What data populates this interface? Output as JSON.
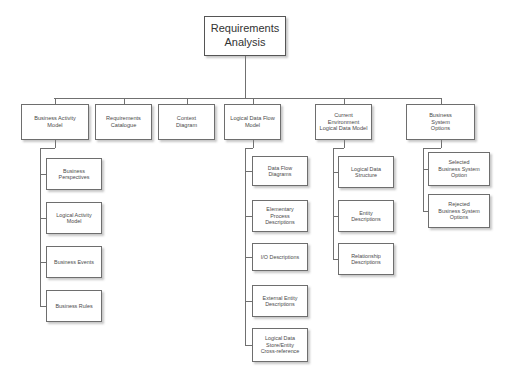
{
  "diagram": {
    "title": "Requirements Analysis",
    "root": {
      "label": "Requirements\nAnalysis",
      "x": 204,
      "y": 16,
      "w": 82,
      "h": 40
    },
    "connector_bar": {
      "y": 98,
      "x_start": 54,
      "x_end": 441
    },
    "columns": [
      {
        "id": "business-activity-model",
        "label": "Business Activity\nModel",
        "x": 21,
        "y": 104,
        "w": 68,
        "h": 36,
        "rail_x": 40,
        "children": [
          {
            "id": "business-perspectives",
            "label": "Business\nPerspectives",
            "x": 46,
            "y": 158,
            "w": 56,
            "h": 32
          },
          {
            "id": "logical-activity-model",
            "label": "Logical Activity\nModel",
            "x": 46,
            "y": 202,
            "w": 56,
            "h": 32
          },
          {
            "id": "business-events",
            "label": "Business Events",
            "x": 46,
            "y": 246,
            "w": 56,
            "h": 32
          },
          {
            "id": "business-rules",
            "label": "Business Rules",
            "x": 46,
            "y": 290,
            "w": 56,
            "h": 32
          }
        ]
      },
      {
        "id": "requirements-catalogue",
        "label": "Requirements\nCatalogue",
        "x": 95,
        "y": 104,
        "w": 57,
        "h": 36,
        "rail_x": null,
        "children": []
      },
      {
        "id": "context-diagram",
        "label": "Context\nDiagram",
        "x": 158,
        "y": 104,
        "w": 57,
        "h": 36,
        "rail_x": null,
        "children": []
      },
      {
        "id": "logical-data-flow-model",
        "label": "Logical Data Flow\nModel",
        "x": 224,
        "y": 104,
        "w": 57,
        "h": 36,
        "rail_x": 245,
        "children": [
          {
            "id": "data-flow-diagrams",
            "label": "Data Flow\nDiagrams",
            "x": 252,
            "y": 156,
            "w": 56,
            "h": 30
          },
          {
            "id": "elementary-process-descriptions",
            "label": "Elementary\nProcess\nDescriptions",
            "x": 252,
            "y": 200,
            "w": 56,
            "h": 32
          },
          {
            "id": "io-descriptions",
            "label": "I/O Descriptions",
            "x": 252,
            "y": 243,
            "w": 56,
            "h": 28
          },
          {
            "id": "external-entity-descriptions",
            "label": "External Entity\nDescriptions",
            "x": 252,
            "y": 285,
            "w": 56,
            "h": 32
          },
          {
            "id": "logical-data-store-entity-cross-reference",
            "label": "Logical Data\nStore/Entity\nCross-reference",
            "x": 252,
            "y": 328,
            "w": 56,
            "h": 34
          }
        ]
      },
      {
        "id": "current-environment-logical-data-model",
        "label": "Current\nEnvironment\nLogical Data Model",
        "x": 315,
        "y": 104,
        "w": 57,
        "h": 36,
        "rail_x": 333,
        "children": [
          {
            "id": "logical-data-structure",
            "label": "Logical Data\nStructure",
            "x": 338,
            "y": 156,
            "w": 56,
            "h": 32
          },
          {
            "id": "entity-descriptions",
            "label": "Entity\nDescriptions",
            "x": 338,
            "y": 200,
            "w": 56,
            "h": 32
          },
          {
            "id": "relationship-descriptions",
            "label": "Relationship\nDescriptions",
            "x": 338,
            "y": 243,
            "w": 56,
            "h": 32
          }
        ]
      },
      {
        "id": "business-system-options",
        "label": "Business\nSystem\nOptions",
        "x": 406,
        "y": 104,
        "w": 69,
        "h": 36,
        "rail_x": 423,
        "children": [
          {
            "id": "selected-business-system-option",
            "label": "Selected\nBusiness System\nOption",
            "x": 428,
            "y": 152,
            "w": 62,
            "h": 34
          },
          {
            "id": "rejected-business-system-options",
            "label": "Rejected\nBusiness System\nOptions",
            "x": 428,
            "y": 194,
            "w": 62,
            "h": 34
          }
        ]
      }
    ]
  }
}
